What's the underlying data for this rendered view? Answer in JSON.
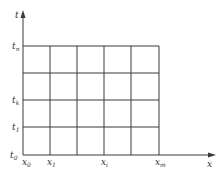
{
  "diagram": {
    "type": "grid-mesh",
    "axes": {
      "x_label": "x",
      "y_label": "t"
    },
    "x_ticks": [
      {
        "base": "x",
        "sub": "0"
      },
      {
        "base": "x",
        "sub": "1"
      },
      {
        "base": "x",
        "sub": "i"
      },
      {
        "base": "x",
        "sub": "m"
      }
    ],
    "t_ticks": [
      {
        "base": "t",
        "sub": "0"
      },
      {
        "base": "t",
        "sub": "1"
      },
      {
        "base": "t",
        "sub": "k"
      },
      {
        "base": "t",
        "sub": "n"
      }
    ],
    "grid": {
      "columns": 5,
      "rows": 4
    },
    "line_color": "#3a3a3a"
  }
}
